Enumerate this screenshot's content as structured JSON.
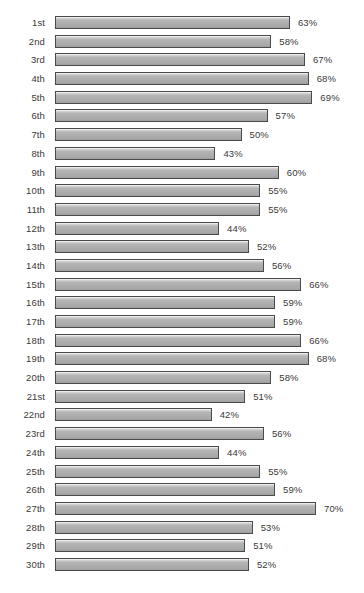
{
  "chart_data": {
    "type": "bar",
    "orientation": "horizontal",
    "title": "",
    "subtitle": "",
    "xlabel": "",
    "ylabel": "",
    "xlim": [
      0,
      70
    ],
    "grid": false,
    "legend": null,
    "value_suffix": "%",
    "categories": [
      "1st",
      "2nd",
      "3rd",
      "4th",
      "5th",
      "6th",
      "7th",
      "8th",
      "9th",
      "10th",
      "11th",
      "12th",
      "13th",
      "14th",
      "15th",
      "16th",
      "17th",
      "18th",
      "19th",
      "20th",
      "21st",
      "22nd",
      "23rd",
      "24th",
      "25th",
      "26th",
      "27th",
      "28th",
      "29th",
      "30th"
    ],
    "values": [
      63,
      58,
      67,
      68,
      69,
      57,
      50,
      43,
      60,
      55,
      55,
      44,
      52,
      56,
      66,
      59,
      59,
      66,
      68,
      58,
      51,
      42,
      56,
      44,
      55,
      59,
      70,
      53,
      51,
      52
    ],
    "value_labels": [
      "63%",
      "58%",
      "67%",
      "68%",
      "69%",
      "57%",
      "50%",
      "43%",
      "60%",
      "55%",
      "55%",
      "44%",
      "52%",
      "56%",
      "66%",
      "59%",
      "59%",
      "66%",
      "68%",
      "58%",
      "51%",
      "42%",
      "56%",
      "44%",
      "55%",
      "59%",
      "70%",
      "53%",
      "51%",
      "52%"
    ],
    "colors": {
      "bar_fill_light": "#d9d9d9",
      "bar_fill_mid": "#b4b4b4",
      "bar_fill_dark": "#9d9d9d",
      "bar_border": "#4a4a4a",
      "text": "#3a3a3a",
      "background": "#ffffff"
    }
  }
}
